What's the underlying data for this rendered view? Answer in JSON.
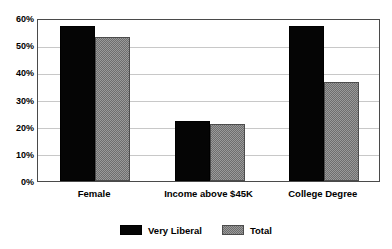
{
  "chart_data": {
    "type": "bar",
    "title": "",
    "subtitle": "",
    "xlabel": "",
    "ylabel": "",
    "categories": [
      "Female",
      "Income above $45K",
      "College Degree"
    ],
    "series": [
      {
        "name": "Very Liberal",
        "color": "#000000",
        "values": [
          57,
          22,
          57
        ]
      },
      {
        "name": "Total",
        "color": "#808080",
        "values": [
          53,
          21,
          36.5
        ]
      }
    ],
    "ylim": [
      0,
      60
    ],
    "ytick_values": [
      0,
      10,
      20,
      30,
      40,
      50,
      60
    ],
    "ytick_labels": [
      "0%",
      "10%",
      "20%",
      "30%",
      "40%",
      "50%",
      "60%"
    ],
    "grid": true,
    "grid_axis": "y",
    "legend_position": "bottom-center",
    "background_color": "#ffffff",
    "plot_border_color": "#4a4a4a",
    "gridline_color": "#c8c8c8"
  },
  "legend": {
    "entries": [
      {
        "label": "Very Liberal",
        "swatch": "solid-black-swatch"
      },
      {
        "label": "Total",
        "swatch": "gray-hatched-swatch"
      }
    ]
  }
}
